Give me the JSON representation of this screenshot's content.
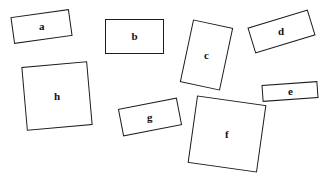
{
  "scene": {
    "title": "Rotated labelled rectangles",
    "background_color": "#ffffff",
    "stroke_color": "#1c1c1c",
    "label_color": "#111111",
    "width": 325,
    "height": 180
  },
  "shapes": [
    {
      "id": "a",
      "label": "a",
      "kind": "rectangle",
      "left": 12,
      "top": 13,
      "width": 59,
      "height": 27,
      "rotation": -8,
      "label_rotation": 8
    },
    {
      "id": "b",
      "label": "b",
      "kind": "rectangle",
      "left": 105,
      "top": 19,
      "width": 59,
      "height": 35,
      "rotation": 0,
      "label_rotation": 0
    },
    {
      "id": "c",
      "label": "c",
      "kind": "rectangle",
      "left": 186,
      "top": 23,
      "width": 41,
      "height": 64,
      "rotation": 12,
      "label_rotation": -12
    },
    {
      "id": "d",
      "label": "d",
      "kind": "rectangle",
      "left": 250,
      "top": 18,
      "width": 63,
      "height": 27,
      "rotation": -17,
      "label_rotation": 17
    },
    {
      "id": "e",
      "label": "e",
      "kind": "rectangle",
      "left": 262,
      "top": 83,
      "width": 56,
      "height": 17,
      "rotation": -4,
      "label_rotation": 4
    },
    {
      "id": "f",
      "label": "f",
      "kind": "rectangle",
      "left": 192,
      "top": 100,
      "width": 70,
      "height": 68,
      "rotation": 8,
      "label_rotation": -8
    },
    {
      "id": "g",
      "label": "g",
      "kind": "rectangle",
      "left": 120,
      "top": 103,
      "width": 60,
      "height": 28,
      "rotation": -11,
      "label_rotation": 11
    },
    {
      "id": "h",
      "label": "h",
      "kind": "rectangle",
      "left": 24,
      "top": 64,
      "width": 66,
      "height": 64,
      "rotation": -5,
      "label_rotation": 5
    }
  ]
}
